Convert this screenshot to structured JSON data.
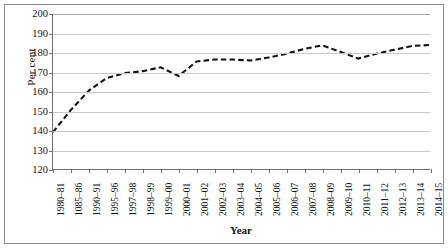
{
  "chart_data": {
    "type": "line",
    "title": "",
    "subtitle": "",
    "xlabel": "Year",
    "ylabel": "Per cent",
    "ylim": [
      120,
      200
    ],
    "ytick_step": 10,
    "yticks": [
      200,
      190,
      180,
      170,
      160,
      150,
      140,
      130,
      120
    ],
    "grid": "horizontal",
    "legend": "none",
    "line_style": "dashed",
    "line_color": "#111111",
    "line_width": 2.1,
    "categories": [
      "1980–81",
      "1085–86",
      "1990–91",
      "1995–96",
      "1997–98",
      "1998–99",
      "1999–00",
      "2000–01",
      "2001–02",
      "2002–03",
      "2003–04",
      "2004–05",
      "2005–06",
      "2006–07",
      "2007–08",
      "2008–09",
      "2009–10",
      "2010–11",
      "2011–12",
      "2012–13",
      "2013–14",
      "2014–15"
    ],
    "series": [
      {
        "name": "Per cent",
        "values": [
          139.0,
          150.5,
          160.5,
          167.0,
          169.5,
          170.5,
          172.5,
          168.0,
          175.5,
          176.5,
          176.5,
          176.0,
          177.5,
          179.5,
          182.0,
          183.8,
          180.5,
          177.0,
          179.5,
          181.5,
          183.5,
          184.0
        ]
      }
    ]
  },
  "axis": {
    "y_title": "Per cent",
    "x_title": "Year"
  }
}
